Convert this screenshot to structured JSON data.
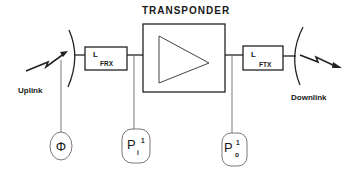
{
  "diagram": {
    "title": "TRANSPONDER",
    "blocks": {
      "rx_filter": {
        "main": "L",
        "subscript": "FRX"
      },
      "tx_filter": {
        "main": "L",
        "subscript": "FTX"
      },
      "amplifier": {
        "symbol": "triangle-amplifier"
      }
    },
    "links": {
      "uplink": "Uplink",
      "downlink": "Downlink"
    },
    "measurements": [
      {
        "id": "phi",
        "symbol": "Φ",
        "superscript": "",
        "subscript": ""
      },
      {
        "id": "p_in",
        "symbol": "P",
        "superscript": "1",
        "subscript": "i"
      },
      {
        "id": "p_out",
        "symbol": "P",
        "superscript": "1",
        "subscript": "o"
      }
    ]
  }
}
